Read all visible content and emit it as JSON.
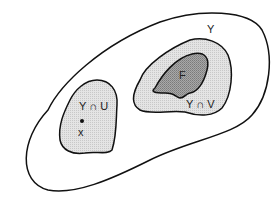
{
  "diagram": {
    "type": "set-diagram",
    "regions": [
      {
        "id": "Y",
        "label": "Y",
        "fill": "#ffffff",
        "stroke": "#111111"
      },
      {
        "id": "Y-cap-V",
        "label": "Y ∩ V",
        "fill": "#d8d8d8",
        "stroke": "#111111"
      },
      {
        "id": "F",
        "label": "F",
        "fill": "#9a9a9a",
        "stroke": "#111111"
      },
      {
        "id": "Y-cap-U",
        "label": "Y ∩ U",
        "fill": "#d8d8d8",
        "stroke": "#111111"
      }
    ],
    "point": {
      "label": "x",
      "color": "#111111"
    }
  }
}
